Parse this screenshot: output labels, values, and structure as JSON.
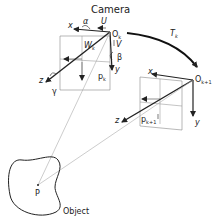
{
  "title": "Camera",
  "object_label": "Object",
  "point_label": "P",
  "transform_label": "T",
  "transform_sub": "k",
  "camera_k": {
    "origin": "O",
    "origin_sub": "k",
    "axis_x": "x",
    "axis_y": "y",
    "axis_z": "z",
    "rot_alpha": "α",
    "rot_beta": "β",
    "rot_gamma": "γ",
    "vel_u": "U",
    "vel_v": "V",
    "vel_w": "W",
    "vel_w_sub": "k",
    "proj_point": "p",
    "proj_point_sub": "k"
  },
  "camera_k1": {
    "origin": "O",
    "origin_sub": "k+1",
    "axis_x": "x",
    "axis_y": "y",
    "axis_z": "z",
    "proj_point": "p",
    "proj_point_sub": "k+1"
  },
  "colors": {
    "line": "#222222",
    "thin": "#888888",
    "ray": "#aaaaaa"
  }
}
